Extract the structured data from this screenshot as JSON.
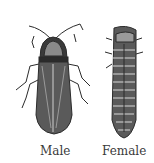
{
  "figure": {
    "labels": {
      "male": "Male",
      "female": "Female"
    },
    "colors": {
      "ink": "#2b2b2b",
      "background": "#ffffff"
    }
  }
}
